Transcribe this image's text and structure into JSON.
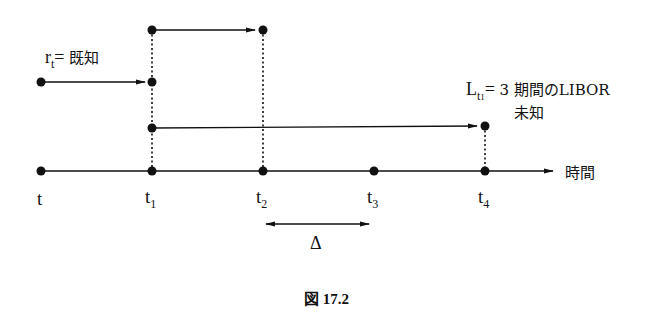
{
  "diagram": {
    "type": "timeline",
    "axis_label": "時間",
    "ticks": [
      {
        "main": "t",
        "sub": ""
      },
      {
        "main": "t",
        "sub": "1"
      },
      {
        "main": "t",
        "sub": "2"
      },
      {
        "main": "t",
        "sub": "3"
      },
      {
        "main": "t",
        "sub": "4"
      }
    ],
    "known_rate": {
      "main": "r",
      "sub": "t",
      "eq": "=",
      "desc": "既知"
    },
    "libor": {
      "main": "L",
      "sub": "t",
      "subsub": "1",
      "eq": "=",
      "desc_line1": "3 期間のLIBOR",
      "desc_line2": "未知"
    },
    "interval_label": "Δ",
    "caption": "図 17.2"
  }
}
